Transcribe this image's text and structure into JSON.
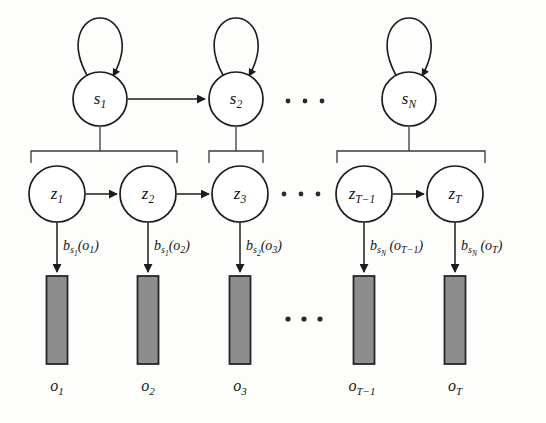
{
  "figure": {
    "background_color": "#fdfdfc",
    "stroke_color": "#1c1c1c",
    "bar_fill_color": "#8d8d8d",
    "bar_stroke_color": "#262626"
  },
  "state_layer": {
    "name": "super-state-row",
    "nodes": [
      {
        "id": "s1",
        "base": "s",
        "sub": "1",
        "cx": 100,
        "cy": 99,
        "r": 27,
        "self_loop": true
      },
      {
        "id": "s2",
        "base": "s",
        "sub": "2",
        "cx": 236,
        "cy": 99,
        "r": 27,
        "self_loop": true
      },
      {
        "id": "sN",
        "base": "s",
        "sub": "N",
        "cx": 409,
        "cy": 99,
        "r": 27,
        "self_loop": true
      }
    ],
    "transitions": [
      {
        "from": "s1",
        "to": "s2"
      }
    ],
    "ellipsis": {
      "cx": 305,
      "cy": 101,
      "count": 3
    }
  },
  "brace_layer": {
    "name": "state-to-substate-braces",
    "braces": [
      {
        "id": "brace-s1",
        "x_left": 31,
        "x_right": 177,
        "y": 151,
        "stem_x": 100,
        "stem_top": 127
      },
      {
        "id": "brace-s2",
        "x_left": 209,
        "x_right": 263,
        "y": 151,
        "stem_x": 236,
        "stem_top": 127
      },
      {
        "id": "brace-sN",
        "x_left": 337,
        "x_right": 485,
        "y": 151,
        "stem_x": 409,
        "stem_top": 127
      }
    ]
  },
  "substate_layer": {
    "name": "sub-state-row",
    "nodes": [
      {
        "id": "z1",
        "base": "z",
        "sub": "1",
        "cx": 57,
        "cy": 194,
        "r": 28
      },
      {
        "id": "z2",
        "base": "z",
        "sub": "2",
        "cx": 148,
        "cy": 194,
        "r": 28
      },
      {
        "id": "z3",
        "base": "z",
        "sub": "3",
        "cx": 240,
        "cy": 194,
        "r": 28
      },
      {
        "id": "zT1",
        "base": "z",
        "sub": "T−1",
        "cx": 364,
        "cy": 194,
        "r": 28
      },
      {
        "id": "zT",
        "base": "z",
        "sub": "T",
        "cx": 455,
        "cy": 194,
        "r": 28
      }
    ],
    "transitions": [
      {
        "from": "z1",
        "to": "z2"
      },
      {
        "from": "z2",
        "to": "z3"
      },
      {
        "from": "zT1",
        "to": "zT"
      }
    ],
    "ellipsis": {
      "cx": 300,
      "cy": 194,
      "count": 3
    }
  },
  "emission_layer": {
    "name": "emission-edges",
    "edges": [
      {
        "id": "emit-1",
        "x": 57,
        "y_top": 222,
        "y_bottom": 272,
        "label_base": "b",
        "label_sub": "s",
        "label_subsub": "1",
        "label_arg": "(o",
        "label_argsub": "1",
        "label_close": ")"
      },
      {
        "id": "emit-2",
        "x": 148,
        "y_top": 222,
        "y_bottom": 272,
        "label_base": "b",
        "label_sub": "s",
        "label_subsub": "1",
        "label_arg": "(o",
        "label_argsub": "2",
        "label_close": ")"
      },
      {
        "id": "emit-3",
        "x": 240,
        "y_top": 222,
        "y_bottom": 272,
        "label_base": "b",
        "label_sub": "s",
        "label_subsub": "2",
        "label_arg": "(o",
        "label_argsub": "3",
        "label_close": ")"
      },
      {
        "id": "emit-4",
        "x": 364,
        "y_top": 222,
        "y_bottom": 272,
        "label_base": "b",
        "label_sub": "s",
        "label_subsub": "N",
        "label_arg": "(o",
        "label_argsub": "T−1",
        "label_close": ")"
      },
      {
        "id": "emit-5",
        "x": 455,
        "y_top": 222,
        "y_bottom": 272,
        "label_base": "b",
        "label_sub": "s",
        "label_subsub": "N",
        "label_arg": "(o",
        "label_argsub": "T",
        "label_close": ")"
      }
    ],
    "label_texts": [
      "b_{s_1}(o_1)",
      "b_{s_1}(o_2)",
      "b_{s_2}(o_3)",
      "b_{s_N}(o_{T-1})",
      "b_{s_N}(o_T)"
    ]
  },
  "observation_layer": {
    "name": "observation-bars",
    "bars": [
      {
        "id": "bar-o1",
        "cx": 57,
        "y": 276,
        "width": 21,
        "height": 88,
        "label_base": "o",
        "label_sub": "1"
      },
      {
        "id": "bar-o2",
        "cx": 148,
        "y": 276,
        "width": 21,
        "height": 88,
        "label_base": "o",
        "label_sub": "2"
      },
      {
        "id": "bar-o3",
        "cx": 240,
        "y": 276,
        "width": 21,
        "height": 88,
        "label_base": "o",
        "label_sub": "3"
      },
      {
        "id": "bar-oT1",
        "cx": 364,
        "y": 276,
        "width": 21,
        "height": 88,
        "label_base": "o",
        "label_sub": "T−1"
      },
      {
        "id": "bar-oT",
        "cx": 455,
        "y": 276,
        "width": 21,
        "height": 88,
        "label_base": "o",
        "label_sub": "T"
      }
    ],
    "label_y": 387,
    "ellipsis": {
      "cx": 303,
      "cy": 319,
      "count": 3
    }
  },
  "chart_data": {
    "type": "diagram",
    "layers": [
      "s (super-states)",
      "z (sub-states)",
      "o (observations)"
    ],
    "state_labels": [
      "s1",
      "s2",
      "sN"
    ],
    "substate_labels": [
      "z1",
      "z2",
      "z3",
      "zT-1",
      "zT"
    ],
    "observation_labels": [
      "o1",
      "o2",
      "o3",
      "oT-1",
      "oT"
    ],
    "emission_labels": [
      "b_{s_1}(o_1)",
      "b_{s_1}(o_2)",
      "b_{s_2}(o_3)",
      "b_{s_N}(o_{T-1})",
      "b_{s_N}(o_T)"
    ]
  }
}
